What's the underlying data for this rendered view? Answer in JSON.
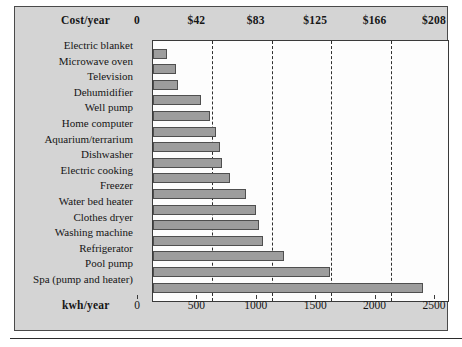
{
  "chart_data": {
    "type": "bar",
    "orientation": "horizontal",
    "title": "",
    "categories": [
      "Electric blanket",
      "Microwave oven",
      "Television",
      "Dehumidifier",
      "Well pump",
      "Home computer",
      "Aquarium/terrarium",
      "Dishwasher",
      "Electric cooking",
      "Freezer",
      "Water bed heater",
      "Clothes dryer",
      "Washing machine",
      "Refrigerator",
      "Pool pump",
      "Spa (pump and heater)"
    ],
    "values": [
      120,
      190,
      210,
      400,
      480,
      530,
      560,
      580,
      650,
      780,
      870,
      890,
      930,
      1100,
      1490,
      2270
    ],
    "series": [
      {
        "name": "kwh/year",
        "values": [
          120,
          190,
          210,
          400,
          480,
          530,
          560,
          580,
          650,
          780,
          870,
          890,
          930,
          1100,
          1490,
          2270
        ]
      }
    ],
    "xlabel": "kwh/year",
    "ylabel": "",
    "xlim": [
      0,
      2500
    ],
    "grid": true,
    "gridlines_at": [
      500,
      1000,
      1500,
      2000
    ],
    "legend": "none",
    "bottom_axis": {
      "title": "kwh/year",
      "ticks": [
        0,
        500,
        1000,
        1500,
        2000,
        2500
      ],
      "tick_labels": [
        "0",
        "500",
        "1000",
        "1500",
        "2000",
        "2500"
      ]
    },
    "top_axis": {
      "title": "Cost/year",
      "ticks": [
        0,
        500,
        1000,
        1500,
        2000,
        2500
      ],
      "tick_labels": [
        "0",
        "$42",
        "$83",
        "$125",
        "$166",
        "$208"
      ]
    },
    "colors": {
      "bar_fill": "#9d9d9d",
      "bar_border": "#4f4f4f",
      "panel_background": "#d4d4d4",
      "plot_background": "#fdfdfd",
      "axis_line": "#3a3a3a",
      "gridline": "#2e2e2e",
      "text": "#151515"
    }
  }
}
